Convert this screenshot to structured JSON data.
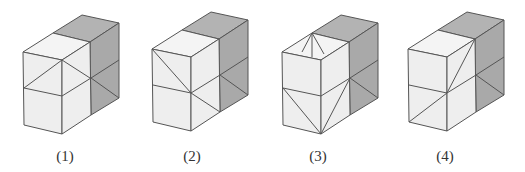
{
  "colors": {
    "light_face": "#eeeeee",
    "light_top": "#f4f4f4",
    "dark_face": "#a9a9a9",
    "dark_top": "#b3b3b3",
    "edge": "#555555"
  },
  "figures": [
    {
      "label": "(1)",
      "origin": [
        23,
        52
      ],
      "label_x": 45,
      "diagonals": [
        [
          "H_top",
          "G"
        ],
        [
          "H_top",
          "I_top"
        ],
        [
          "I",
          "N"
        ]
      ]
    },
    {
      "label": "(2)",
      "origin": [
        152,
        49
      ],
      "label_x": 172,
      "diagonals": [
        [
          "A",
          "H"
        ],
        [
          "H",
          "L"
        ],
        [
          "I",
          "N"
        ]
      ]
    },
    {
      "label": "(3)",
      "origin": [
        282,
        52
      ],
      "label_x": 298,
      "diagonals": [
        [
          "D",
          "T1"
        ],
        [
          "D",
          "T2"
        ],
        [
          "D",
          "T3"
        ],
        [
          "G",
          "K"
        ],
        [
          "I",
          "K"
        ],
        [
          "I",
          "N"
        ]
      ]
    },
    {
      "label": "(4)",
      "origin": [
        408,
        49
      ],
      "label_x": 425,
      "diagonals": [
        [
          "C",
          "H"
        ],
        [
          "H",
          "J"
        ],
        [
          "I",
          "N"
        ]
      ]
    }
  ]
}
